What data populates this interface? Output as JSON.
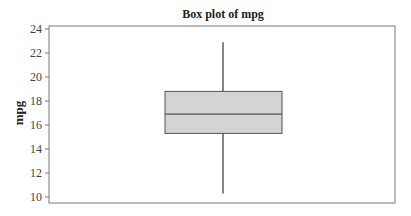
{
  "chart_data": {
    "type": "box",
    "title": "Box plot of mpg",
    "xlabel": "",
    "ylabel": "mpg",
    "ylim": [
      10,
      24
    ],
    "yticks": [
      10,
      12,
      14,
      16,
      18,
      20,
      22,
      24
    ],
    "ytick_labels": [
      "10",
      "12",
      "14",
      "16",
      "18",
      "20",
      "22",
      "24"
    ],
    "grid": false,
    "legend": null,
    "series": [
      {
        "name": "mpg",
        "whisker_low": 10.3,
        "q1": 15.3,
        "median": 16.9,
        "q3": 18.8,
        "whisker_high": 22.9
      }
    ],
    "colors": {
      "box_fill": "#d4d4d4",
      "box_stroke": "#555555",
      "median_line": "#555555",
      "whisker": "#333333",
      "frame": "#777777"
    }
  }
}
